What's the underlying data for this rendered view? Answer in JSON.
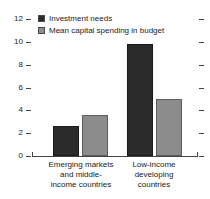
{
  "chart_data": {
    "type": "bar",
    "title": "",
    "xlabel": "",
    "ylabel": "",
    "ylim": [
      0,
      12
    ],
    "yticks": [
      0,
      2,
      4,
      6,
      8,
      10,
      12
    ],
    "grid": false,
    "legend_position": "top-left",
    "categories": [
      "Emerging markets and middle-income countries",
      "Low-income developing countries"
    ],
    "category_lines": [
      [
        "Emerging markets",
        "and middle-",
        "income countries"
      ],
      [
        "Low-income",
        "developing",
        "countries"
      ]
    ],
    "series": [
      {
        "name": "Investment needs",
        "color": "#2b2b2b",
        "values": [
          2.6,
          9.8
        ]
      },
      {
        "name": "Mean capital spending in budget",
        "color": "#8c8c8c",
        "values": [
          3.6,
          5.0
        ]
      }
    ]
  },
  "legend": {
    "items": [
      {
        "label": "Investment needs"
      },
      {
        "label": "Mean capital spending in budget"
      }
    ]
  },
  "axis": {
    "y_tick_labels": [
      "12",
      "10",
      "8",
      "6",
      "4",
      "2",
      "0"
    ]
  },
  "colors": {
    "series_dark": "#2b2b2b",
    "series_gray": "#8c8c8c",
    "axis": "#444444",
    "text": "#1a1a1a",
    "background": "#ffffff"
  }
}
